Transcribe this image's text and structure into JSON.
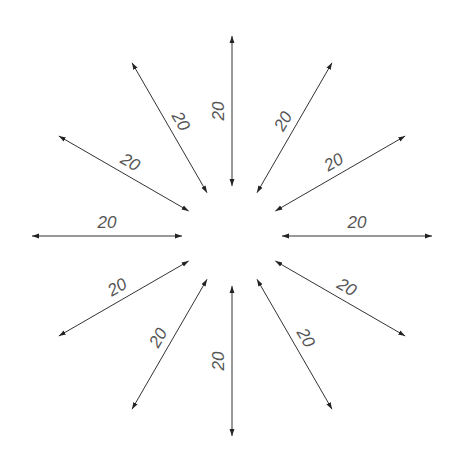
{
  "diagram": {
    "center": [
      232,
      236
    ],
    "inner_radius": 50,
    "outer_radius": 200,
    "line_color": "#333333",
    "text_color": "#555555",
    "arrows": [
      {
        "angle": 0,
        "label": "20"
      },
      {
        "angle": 30,
        "label": "20"
      },
      {
        "angle": 60,
        "label": "20"
      },
      {
        "angle": 90,
        "label": "20"
      },
      {
        "angle": 120,
        "label": "20"
      },
      {
        "angle": 150,
        "label": "20"
      },
      {
        "angle": 180,
        "label": "20"
      },
      {
        "angle": 210,
        "label": "20"
      },
      {
        "angle": 240,
        "label": "20"
      },
      {
        "angle": 270,
        "label": "20"
      },
      {
        "angle": 300,
        "label": "20"
      },
      {
        "angle": 330,
        "label": "20"
      }
    ]
  }
}
